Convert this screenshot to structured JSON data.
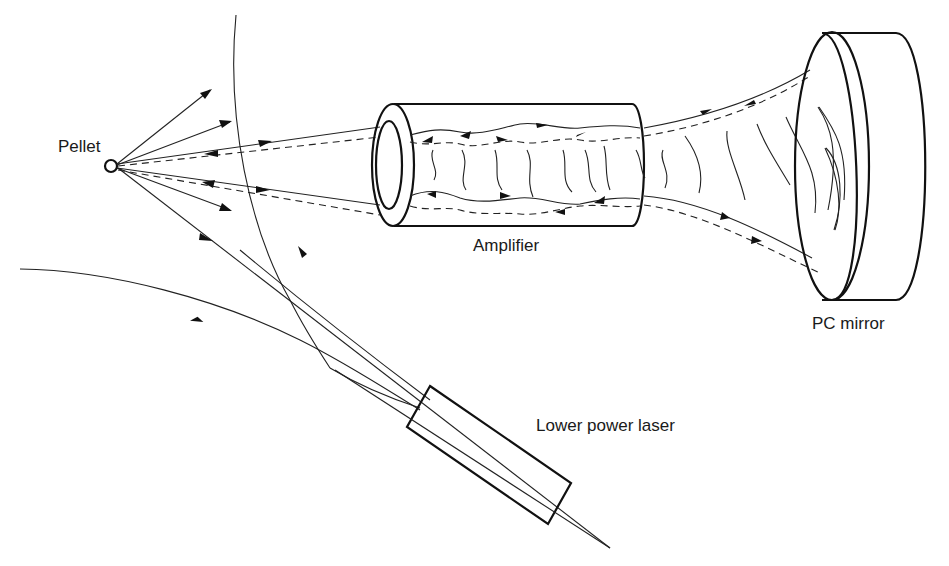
{
  "diagram": {
    "type": "optical schematic",
    "labels": {
      "pellet": "Pellet",
      "amplifier": "Amplifier",
      "pc_mirror": "PC mirror",
      "laser": "Lower power laser"
    },
    "components": [
      "pellet",
      "amplifier",
      "pc_mirror",
      "lower_power_laser"
    ],
    "line_styles": {
      "solid": "outgoing beam",
      "dashed": "phase-conjugated return beam"
    },
    "colors": {
      "ink": "#111111",
      "background": "#ffffff"
    }
  }
}
